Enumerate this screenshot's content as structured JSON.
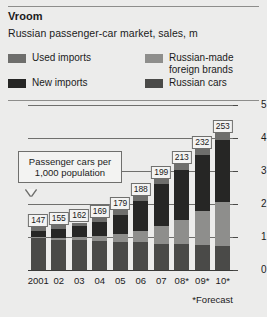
{
  "header": {
    "title": "Vroom",
    "subtitle": "Russian passenger-car market, sales, m"
  },
  "legend": {
    "items": [
      {
        "label": "Used imports",
        "color": "#6e6e6c"
      },
      {
        "label": "New imports",
        "color": "#262625"
      },
      {
        "label": "Russian-made\nforeign brands",
        "color": "#8e8e8c"
      },
      {
        "label": "Russian cars",
        "color": "#4a4a48"
      }
    ]
  },
  "annotation": {
    "text": "Passenger cars per\n1,000 population"
  },
  "footnote": "*Forecast",
  "chart_data": {
    "type": "bar",
    "stacked": true,
    "title": "Russian passenger-car market, sales, m",
    "xlabel": "",
    "ylabel": "",
    "ylim": [
      0,
      5
    ],
    "yticks": [
      0,
      1,
      2,
      3,
      4,
      5
    ],
    "grid": true,
    "legend_position": "top",
    "categories": [
      "2001",
      "02",
      "03",
      "04",
      "05",
      "06",
      "07",
      "08*",
      "09*",
      "10*"
    ],
    "series": [
      {
        "name": "Russian cars",
        "color": "#4a4a48",
        "values": [
          0.98,
          0.92,
          0.9,
          0.88,
          0.86,
          0.84,
          0.8,
          0.78,
          0.75,
          0.72
        ]
      },
      {
        "name": "Russian-made foreign brands",
        "color": "#8e8e8c",
        "values": [
          0.02,
          0.05,
          0.09,
          0.14,
          0.22,
          0.34,
          0.52,
          0.74,
          1.05,
          1.35
        ]
      },
      {
        "name": "New imports",
        "color": "#262625",
        "values": [
          0.18,
          0.26,
          0.33,
          0.42,
          0.6,
          0.92,
          1.28,
          1.5,
          1.7,
          1.88
        ]
      },
      {
        "name": "Used imports",
        "color": "#6e6e6c",
        "values": [
          0.12,
          0.12,
          0.12,
          0.13,
          0.14,
          0.15,
          0.17,
          0.18,
          0.18,
          0.19
        ]
      }
    ],
    "point_labels": {
      "name": "Passenger cars per 1,000 population",
      "values": [
        147,
        155,
        162,
        169,
        179,
        188,
        199,
        213,
        232,
        253
      ]
    }
  }
}
